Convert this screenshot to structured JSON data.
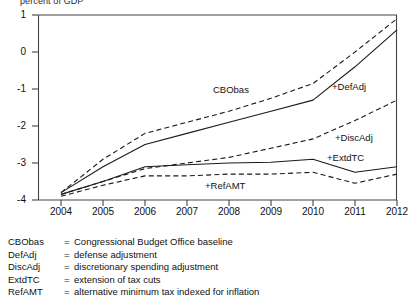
{
  "header": {
    "note": "percent of GDP"
  },
  "axes": {
    "y_ticks": [
      "1",
      "0",
      "-1",
      "-2",
      "-3",
      "-4"
    ],
    "x_ticks": [
      "2004",
      "2005",
      "2006",
      "2007",
      "2008",
      "2009",
      "2010",
      "2011",
      "2012"
    ]
  },
  "series_labels": {
    "cbobas": "CBObas",
    "defadj": "+DefAdj",
    "discadj": "+DiscAdj",
    "extdtc": "+ExtdTC",
    "refamt": "+RefAMT"
  },
  "legend": [
    {
      "key": "CBObas",
      "eq": "=",
      "desc": "Congressional Budget Office baseline"
    },
    {
      "key": "DefAdj",
      "eq": "=",
      "desc": "defense adjustment"
    },
    {
      "key": "DiscAdj",
      "eq": "=",
      "desc": "discretionary spending adjustment"
    },
    {
      "key": "ExtdTC",
      "eq": "=",
      "desc": "extension of tax cuts"
    },
    {
      "key": "RefAMT",
      "eq": "=",
      "desc": "alternative minimum tax indexed for inflation"
    }
  ],
  "chart_data": {
    "type": "line",
    "title": "",
    "xlabel": "",
    "ylabel": "percent of GDP",
    "x": [
      2004,
      2005,
      2006,
      2007,
      2008,
      2009,
      2010,
      2011,
      2012
    ],
    "xlim": [
      2004,
      2012
    ],
    "ylim": [
      -4,
      1
    ],
    "grid": false,
    "legend_position": "below-plot",
    "series": [
      {
        "name": "CBObas",
        "label": "CBObas",
        "style": "solid",
        "values": [
          -3.8,
          -3.1,
          -2.5,
          -2.2,
          -1.9,
          -1.6,
          -1.3,
          -0.4,
          0.6
        ]
      },
      {
        "name": "+DefAdj",
        "label": "+DefAdj",
        "style": "dashed",
        "values": [
          -3.8,
          -2.9,
          -2.2,
          -1.9,
          -1.6,
          -1.25,
          -0.85,
          0.0,
          0.9
        ]
      },
      {
        "name": "+DiscAdj",
        "label": "+DiscAdj",
        "style": "dashed",
        "values": [
          -3.85,
          -3.5,
          -3.15,
          -3.0,
          -2.85,
          -2.6,
          -2.35,
          -1.85,
          -1.3
        ]
      },
      {
        "name": "+ExtdTC",
        "label": "+ExtdTC",
        "style": "solid",
        "values": [
          -3.85,
          -3.5,
          -3.1,
          -3.05,
          -3.0,
          -2.98,
          -2.9,
          -3.25,
          -3.1
        ]
      },
      {
        "name": "+RefAMT",
        "label": "+RefAMT",
        "style": "dashed",
        "values": [
          -3.9,
          -3.6,
          -3.35,
          -3.35,
          -3.3,
          -3.3,
          -3.25,
          -3.55,
          -3.3
        ]
      }
    ]
  }
}
